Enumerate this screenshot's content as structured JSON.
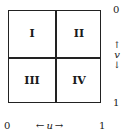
{
  "diagram": {
    "type": "unit-square-quadrants",
    "quadrants": [
      {
        "id": "I",
        "label": "I",
        "position": "top-left"
      },
      {
        "id": "II",
        "label": "II",
        "position": "top-right"
      },
      {
        "id": "III",
        "label": "III",
        "position": "bottom-left"
      },
      {
        "id": "IV",
        "label": "IV",
        "position": "bottom-right"
      }
    ],
    "v_axis": {
      "top_label": "0",
      "bottom_label": "1",
      "variable": "v",
      "up_arrow": "↑",
      "down_arrow": "↓"
    },
    "u_axis": {
      "left_label": "0",
      "right_label": "1",
      "variable": "u",
      "left_arrow": "←",
      "right_arrow": "→"
    }
  }
}
